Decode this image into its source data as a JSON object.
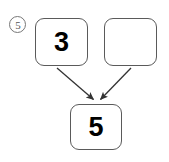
{
  "worksheet": {
    "item_number": "5",
    "item_number_style": "circled",
    "background_color": "#ffffff",
    "box_border_color": "#5a5a5a",
    "digit_color": "#000000",
    "arrow_color": "#333333"
  },
  "boxes": [
    {
      "name": "addend-1",
      "value": "3",
      "empty": false
    },
    {
      "name": "addend-2",
      "value": "",
      "empty": true
    },
    {
      "name": "sum",
      "value": "5",
      "empty": false
    }
  ],
  "arrows": [
    {
      "name": "arrow-left",
      "from": "addend-1",
      "to": "sum"
    },
    {
      "name": "arrow-right",
      "from": "addend-2",
      "to": "sum"
    }
  ]
}
